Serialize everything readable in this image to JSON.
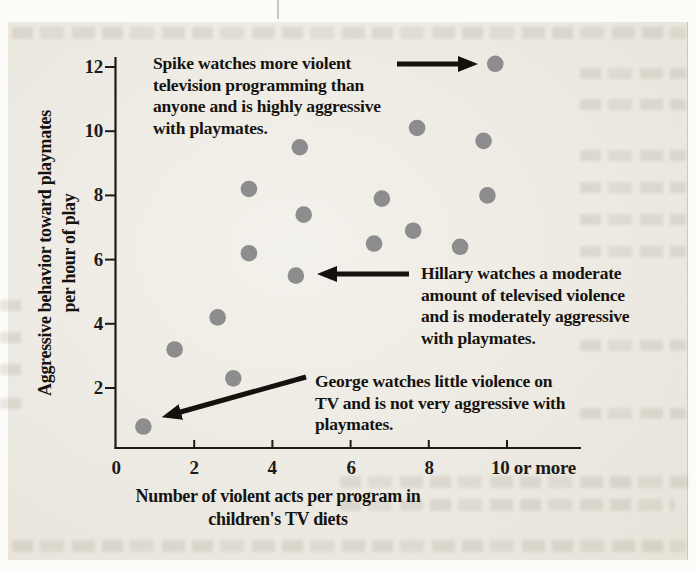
{
  "figure": {
    "page_background": "#edeae3",
    "dot_color": "#8d8d8d",
    "axis_color": "#1d1b18",
    "text_color": "#15130f",
    "arrow_color": "#14120d"
  },
  "chart_data": {
    "type": "scatter",
    "title": "",
    "xlabel_lines": [
      "Number of violent acts per program in",
      "children's TV diets"
    ],
    "ylabel_lines": [
      "Aggressive behavior toward playmates",
      "per hour of play"
    ],
    "x_tick_labels": [
      "0",
      "2",
      "4",
      "6",
      "8",
      "10 or more"
    ],
    "x_tick_values": [
      0,
      2,
      4,
      6,
      8,
      10
    ],
    "y_tick_labels": [
      "12",
      "10",
      "8",
      "6",
      "4",
      "2"
    ],
    "y_tick_values": [
      12,
      10,
      8,
      6,
      4,
      2
    ],
    "xlim": [
      0,
      11.9
    ],
    "ylim": [
      0,
      12.3
    ],
    "grid": false,
    "legend": "none",
    "points": [
      [
        0.7,
        0.8
      ],
      [
        1.5,
        3.2
      ],
      [
        2.6,
        4.2
      ],
      [
        3.0,
        2.3
      ],
      [
        3.4,
        6.2
      ],
      [
        3.4,
        8.2
      ],
      [
        4.6,
        5.5
      ],
      [
        4.7,
        9.5
      ],
      [
        4.8,
        7.4
      ],
      [
        6.6,
        6.5
      ],
      [
        6.8,
        7.9
      ],
      [
        7.6,
        6.9
      ],
      [
        7.7,
        10.1
      ],
      [
        8.8,
        6.4
      ],
      [
        9.4,
        9.7
      ],
      [
        9.5,
        8.0
      ],
      [
        9.7,
        12.1
      ]
    ],
    "labeled_points": {
      "spike": [
        9.7,
        12.1
      ],
      "hillary": [
        4.6,
        5.5
      ],
      "george": [
        0.7,
        0.8
      ]
    }
  },
  "annotations": {
    "spike": {
      "lines": [
        "Spike watches more violent",
        "television programming than",
        "anyone and is highly aggressive",
        "with playmates."
      ]
    },
    "hillary": {
      "lines": [
        "Hillary watches a moderate",
        "amount of televised violence",
        "and is moderately aggressive",
        "with playmates."
      ]
    },
    "george": {
      "lines": [
        "George watches little violence on",
        "TV and is not very aggressive with",
        "playmates."
      ]
    }
  }
}
